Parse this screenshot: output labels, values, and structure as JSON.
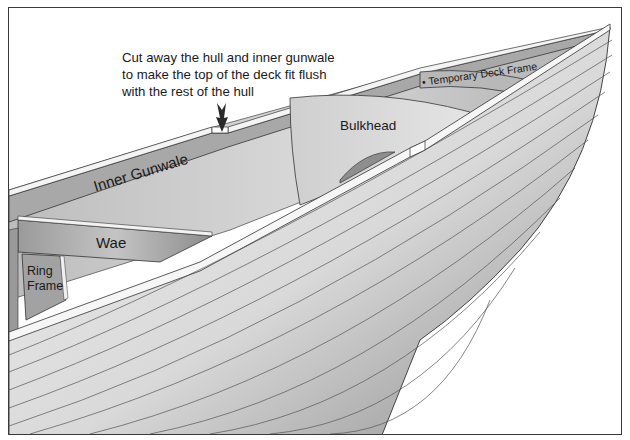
{
  "diagram": {
    "callout": {
      "lines": [
        "Cut away the hull and inner gunwale",
        "to make the top of the deck fit flush",
        "with the rest of the hull"
      ],
      "pointer": "arrow-down"
    },
    "labels": {
      "inner_gunwale": "Inner Gunwale",
      "bulkhead": "Bulkhead",
      "temporary_deck_frame": "Temporary Deck Frame",
      "temporary_deck_frame_bullet": "•",
      "wae": "Wae",
      "ring_frame_line1": "Ring",
      "ring_frame_line2": "Frame"
    },
    "colors": {
      "hull_light": "#ececec",
      "hull_dark": "#8f8f8f",
      "interior": "#c8c8c8",
      "member": "#a9a9a9",
      "outline": "#2e2e2e",
      "border": "#3a3a3a"
    }
  }
}
